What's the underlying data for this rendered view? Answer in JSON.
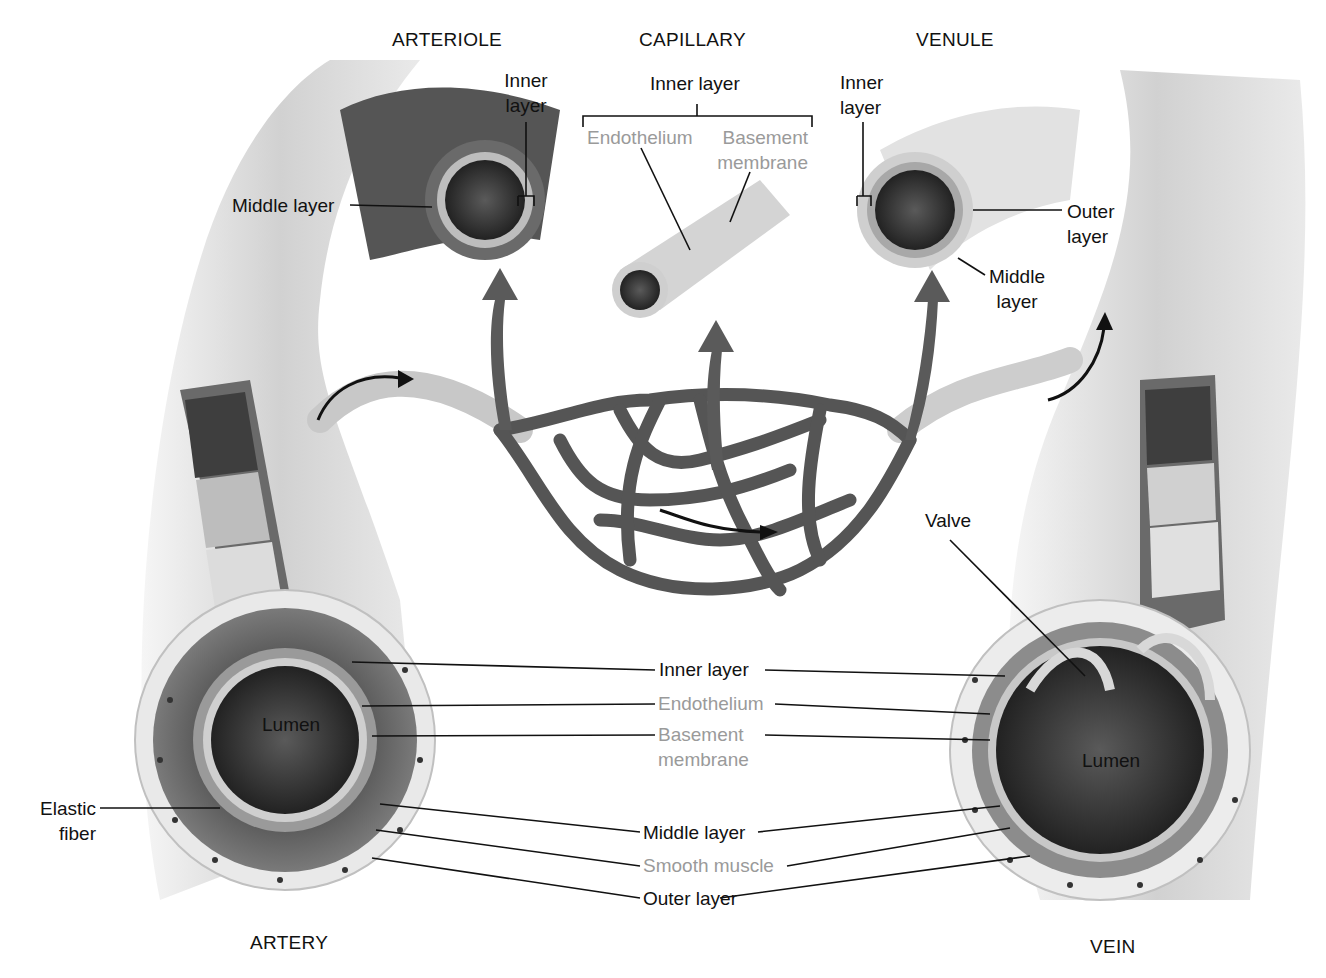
{
  "diagram": {
    "type": "anatomy"
  },
  "titles": {
    "arteriole": "ARTERIOLE",
    "capillary": "CAPILLARY",
    "venule": "VENULE",
    "artery": "ARTERY",
    "vein": "VEIN"
  },
  "arteriole_labels": {
    "inner_layer_1": "Inner",
    "inner_layer_2": "layer",
    "middle_layer": "Middle layer"
  },
  "capillary_labels": {
    "inner_layer": "Inner layer",
    "endothelium": "Endothelium",
    "basement_1": "Basement",
    "basement_2": "membrane"
  },
  "venule_labels": {
    "inner_layer_1": "Inner",
    "inner_layer_2": "layer",
    "outer_layer_1": "Outer",
    "outer_layer_2": "layer",
    "middle_layer_1": "Middle",
    "middle_layer_2": "layer"
  },
  "artery_labels": {
    "lumen": "Lumen",
    "elastic_1": "Elastic",
    "elastic_2": "fiber"
  },
  "vein_labels": {
    "valve": "Valve",
    "lumen": "Lumen"
  },
  "shared_labels": {
    "inner_layer": "Inner layer",
    "endothelium": "Endothelium",
    "basement_1": "Basement",
    "basement_2": "membrane",
    "middle_layer": "Middle layer",
    "smooth_muscle": "Smooth muscle",
    "outer_layer": "Outer layer"
  },
  "colors": {
    "label_black": "#111111",
    "label_gray": "#9a9a9a",
    "vessel_dark": "#4a4a4a",
    "vessel_light": "#d6d6d6"
  }
}
